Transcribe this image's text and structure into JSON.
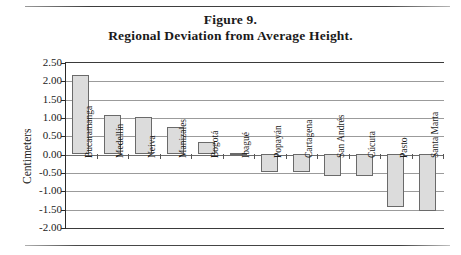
{
  "figure": {
    "rule_top": "",
    "rule_bottom": "",
    "title_line1": "Figure 9.",
    "title_line2": "Regional Deviation from Average Height."
  },
  "chart_data": {
    "type": "bar",
    "title": "Regional Deviation from Average Height.",
    "subtitle": "Figure 9.",
    "xlabel": "",
    "ylabel": "Centimeters",
    "ylim": [
      -2.0,
      2.5
    ],
    "ytick_step": 0.5,
    "ytick_labels": [
      "2.50",
      "2.00",
      "1.50",
      "1.00",
      "0.50",
      "0.00",
      "-0.50",
      "-1.00",
      "-1.50",
      "-2.00"
    ],
    "ytick_values": [
      2.5,
      2.0,
      1.5,
      1.0,
      0.5,
      0.0,
      -0.5,
      -1.0,
      -1.5,
      -2.0
    ],
    "grid": true,
    "legend": false,
    "categories": [
      "Bucaramanga",
      "Medellín",
      "Neiva",
      "Manizales",
      "Bogotá",
      "Ibagué",
      "Popayán",
      "Cartagena",
      "San Andrés",
      "Cúcuta",
      "Pasto",
      "Santa Marta"
    ],
    "values": [
      2.15,
      1.05,
      1.0,
      0.72,
      0.33,
      0.03,
      -0.5,
      -0.5,
      -0.62,
      -0.6,
      -1.45,
      -1.57
    ],
    "bar_fill": "#dcdcdc",
    "bar_edge": "#6a6a6a"
  }
}
